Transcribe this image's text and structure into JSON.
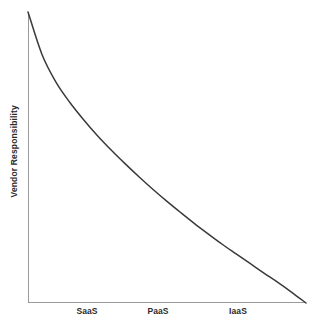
{
  "figure": {
    "background_color": "#ffffff",
    "width": 317,
    "height": 331
  },
  "axes": {
    "y_axis_label": "Vendor Responsibility",
    "x_axis_label": "",
    "axis_line_color": "#9a9a9a",
    "origin_x": 28,
    "origin_y": 303,
    "x_axis_right": 306,
    "y_axis_top": 12
  },
  "curve": {
    "color": "#3a3a3a",
    "width": 1.5,
    "name": "vendor-responsibility-curve"
  },
  "x_ticks": [
    {
      "label": "SaaS",
      "x": 87
    },
    {
      "label": "PaaS",
      "x": 158
    },
    {
      "label": "IaaS",
      "x": 238
    }
  ],
  "chart_data": {
    "type": "line",
    "title": "",
    "subtitle": "",
    "xlabel": "",
    "ylabel": "Vendor Responsibility",
    "categories": [
      "SaaS",
      "PaaS",
      "IaaS"
    ],
    "tick_labels": [
      "SaaS",
      "PaaS",
      "IaaS"
    ],
    "legend": [],
    "legend_position": "none",
    "grid": false,
    "xlim": [
      0,
      1
    ],
    "ylim": [
      0,
      1
    ],
    "axis_ticks_shown": false,
    "axis_values_shown": false,
    "series": [
      {
        "name": "Vendor Responsibility",
        "color": "#3a3a3a",
        "x": [
          0.0,
          0.05,
          0.1,
          0.15,
          0.2,
          0.25,
          0.3,
          0.35,
          0.4,
          0.45,
          0.5,
          0.55,
          0.6,
          0.65,
          0.7,
          0.75,
          0.8,
          0.85,
          0.9,
          0.95,
          1.0
        ],
        "y": [
          1.0,
          0.855,
          0.76,
          0.69,
          0.63,
          0.575,
          0.525,
          0.478,
          0.433,
          0.39,
          0.349,
          0.31,
          0.272,
          0.236,
          0.201,
          0.168,
          0.135,
          0.102,
          0.07,
          0.036,
          0.0
        ]
      }
    ],
    "annotations": []
  }
}
